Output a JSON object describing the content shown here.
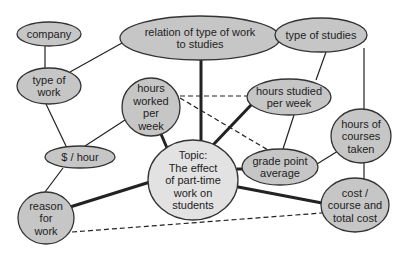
{
  "diagram": {
    "type": "concept-map",
    "colors": {
      "node_fill": "#c6c6c6",
      "topic_fill": "#e2e2e2",
      "stroke": "#222222",
      "background": "#ffffff"
    },
    "nodes": [
      {
        "id": "company",
        "lines": [
          "company"
        ],
        "cx": 49,
        "cy": 34,
        "rx": 32,
        "ry": 12
      },
      {
        "id": "relation",
        "lines": [
          "relation of type of work",
          "to studies"
        ],
        "cx": 200,
        "cy": 38,
        "rx": 80,
        "ry": 22
      },
      {
        "id": "type-of-studies",
        "lines": [
          "type of studies"
        ],
        "cx": 321,
        "cy": 35,
        "rx": 46,
        "ry": 17
      },
      {
        "id": "type-of-work",
        "lines": [
          "type of",
          "work"
        ],
        "cx": 49,
        "cy": 86,
        "rx": 32,
        "ry": 18
      },
      {
        "id": "hours-worked",
        "lines": [
          "hours",
          "worked",
          "per",
          "week"
        ],
        "cx": 151,
        "cy": 107,
        "rx": 29,
        "ry": 29
      },
      {
        "id": "hours-studied",
        "lines": [
          "hours studied",
          "per week"
        ],
        "cx": 289,
        "cy": 97,
        "rx": 42,
        "ry": 18
      },
      {
        "id": "hours-courses",
        "lines": [
          "hours of",
          "courses",
          "taken"
        ],
        "cx": 361,
        "cy": 136,
        "rx": 30,
        "ry": 27
      },
      {
        "id": "dollar-hour",
        "lines": [
          "$ / hour"
        ],
        "cx": 80,
        "cy": 157,
        "rx": 35,
        "ry": 11
      },
      {
        "id": "topic",
        "lines": [
          "Topic:",
          "The effect",
          "of part-time",
          "work on",
          "students"
        ],
        "cx": 193,
        "cy": 180,
        "rx": 45,
        "ry": 40,
        "central": true
      },
      {
        "id": "gpa",
        "lines": [
          "grade point",
          "average"
        ],
        "cx": 280,
        "cy": 167,
        "rx": 38,
        "ry": 18
      },
      {
        "id": "reason",
        "lines": [
          "reason",
          "for",
          "work"
        ],
        "cx": 46,
        "cy": 218,
        "rx": 28,
        "ry": 26
      },
      {
        "id": "cost",
        "lines": [
          "cost /",
          "course and",
          "total cost"
        ],
        "cx": 355,
        "cy": 205,
        "rx": 34,
        "ry": 27
      }
    ],
    "edges": [
      {
        "from": "company",
        "to": "type-of-work",
        "style": "thin",
        "x1": 45,
        "y1": 46,
        "x2": 45,
        "y2": 68
      },
      {
        "from": "type-of-work",
        "to": "relation",
        "style": "thin",
        "x1": 70,
        "y1": 72,
        "x2": 122,
        "y2": 43
      },
      {
        "from": "type-of-work",
        "to": "dollar-hour",
        "style": "thin",
        "x1": 46,
        "y1": 104,
        "x2": 66,
        "y2": 146
      },
      {
        "from": "hours-worked",
        "to": "dollar-hour",
        "style": "thin",
        "x1": 125,
        "y1": 120,
        "x2": 85,
        "y2": 146
      },
      {
        "from": "dollar-hour",
        "to": "reason",
        "style": "thin",
        "x1": 63,
        "y1": 168,
        "x2": 45,
        "y2": 192
      },
      {
        "from": "relation",
        "to": "topic",
        "style": "thick",
        "x1": 201,
        "y1": 60,
        "x2": 201,
        "y2": 140
      },
      {
        "from": "relation",
        "to": "type-of-studies",
        "style": "dashed",
        "x1": 280,
        "y1": 36,
        "x2": 275,
        "y2": 36
      },
      {
        "from": "type-of-studies",
        "to": "hours-studied",
        "style": "thin",
        "x1": 326,
        "y1": 52,
        "x2": 316,
        "y2": 80
      },
      {
        "from": "type-of-studies",
        "to": "hours-courses",
        "style": "thin",
        "x1": 364,
        "y1": 48,
        "x2": 364,
        "y2": 109
      },
      {
        "from": "hours-worked",
        "to": "topic",
        "style": "thick",
        "x1": 161,
        "y1": 134,
        "x2": 167,
        "y2": 148
      },
      {
        "from": "hours-worked",
        "to": "hours-studied",
        "style": "dashed",
        "x1": 180,
        "y1": 96,
        "x2": 247,
        "y2": 96
      },
      {
        "from": "hours-worked",
        "to": "gpa",
        "style": "dashed",
        "x1": 180,
        "y1": 98,
        "x2": 268,
        "y2": 150
      },
      {
        "from": "hours-studied",
        "to": "topic",
        "style": "thick",
        "x1": 252,
        "y1": 104,
        "x2": 213,
        "y2": 145
      },
      {
        "from": "hours-studied",
        "to": "gpa",
        "style": "thin",
        "x1": 294,
        "y1": 115,
        "x2": 283,
        "y2": 149
      },
      {
        "from": "hours-courses",
        "to": "gpa",
        "style": "thin",
        "x1": 338,
        "y1": 151,
        "x2": 317,
        "y2": 164
      },
      {
        "from": "hours-courses",
        "to": "cost",
        "style": "thin",
        "x1": 364,
        "y1": 163,
        "x2": 364,
        "y2": 186
      },
      {
        "from": "topic",
        "to": "gpa",
        "style": "thick",
        "x1": 237,
        "y1": 169,
        "x2": 242,
        "y2": 169
      },
      {
        "from": "topic",
        "to": "reason",
        "style": "thick",
        "x1": 150,
        "y1": 182,
        "x2": 70,
        "y2": 207
      },
      {
        "from": "topic",
        "to": "cost",
        "style": "thick",
        "x1": 233,
        "y1": 186,
        "x2": 322,
        "y2": 203
      },
      {
        "from": "reason",
        "to": "cost",
        "style": "dashed",
        "x1": 72,
        "y1": 232,
        "x2": 322,
        "y2": 213
      }
    ]
  }
}
